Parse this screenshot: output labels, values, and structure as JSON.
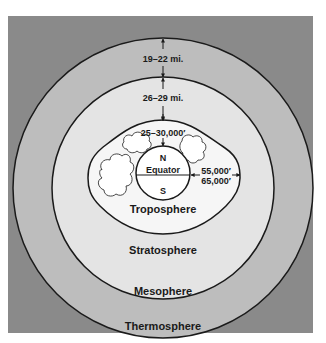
{
  "diagram": {
    "colors": {
      "thermosphere": "#8a8a8a",
      "mesosphere": "#bdbdbd",
      "stratosphere": "#e4e4e4",
      "troposphere": "#f6f6f6",
      "earth": "#ffffff",
      "line": "#1a1a1a"
    },
    "layers": {
      "thermosphere": "Thermosphere",
      "mesosphere": "Mesophere",
      "stratosphere": "Stratosphere",
      "troposphere": "Troposphere"
    },
    "earth": {
      "north": "N",
      "south": "S",
      "equator": "Equator"
    },
    "measurements": {
      "mesosphere_thickness": "19–22 mi.",
      "stratosphere_thickness": "26–29 mi.",
      "troposphere_pole_height": "25–30,000′",
      "troposphere_equator_height_1": "55,000′",
      "troposphere_equator_height_2": "65,000′"
    }
  }
}
